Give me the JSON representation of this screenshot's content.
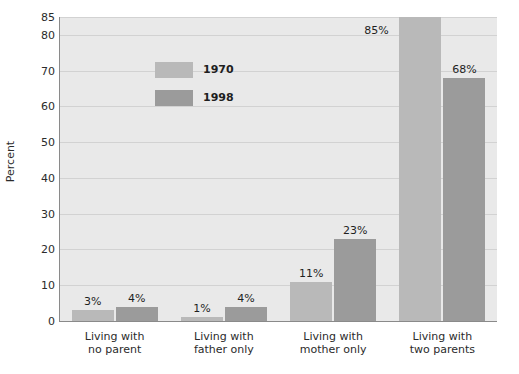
{
  "chart_data": {
    "type": "bar",
    "title": "",
    "subtitle": "",
    "xlabel": "",
    "ylabel": "Percent",
    "ylim": [
      0,
      85
    ],
    "yticks": [
      0,
      10,
      20,
      30,
      40,
      50,
      60,
      70,
      80,
      85
    ],
    "ytick_labels": [
      "0",
      "10",
      "20",
      "30",
      "40",
      "50",
      "60",
      "70",
      "80",
      "85"
    ],
    "grid": true,
    "legend_position": "inside-upper-left",
    "categories": [
      "Living with\nno parent",
      "Living with\nfather only",
      "Living with\nmother only",
      "Living with\ntwo parents"
    ],
    "categories_lines": [
      [
        "Living with",
        "no parent"
      ],
      [
        "Living with",
        "father only"
      ],
      [
        "Living with",
        "mother only"
      ],
      [
        "Living with",
        "two parents"
      ]
    ],
    "series": [
      {
        "name": "1970",
        "color": "#b9b9b9",
        "values": [
          3,
          1,
          11,
          85
        ],
        "value_labels": [
          "3%",
          "1%",
          "11%",
          "85%"
        ]
      },
      {
        "name": "1998",
        "color": "#9b9b9b",
        "values": [
          4,
          4,
          23,
          68
        ],
        "value_labels": [
          "4%",
          "4%",
          "23%",
          "68%"
        ]
      }
    ]
  },
  "colors": {
    "series_1970": "#b9b9b9",
    "series_1998": "#9b9b9b",
    "plot_background": "#e9e9e9",
    "gridline": "#d2d2d2",
    "axis": "#8a8a8a",
    "text": "#2b2b2b",
    "page_background": "#ffffff"
  },
  "legend": {
    "items": [
      {
        "label": "1970",
        "color": "#b9b9b9"
      },
      {
        "label": "1998",
        "color": "#9b9b9b"
      }
    ]
  }
}
